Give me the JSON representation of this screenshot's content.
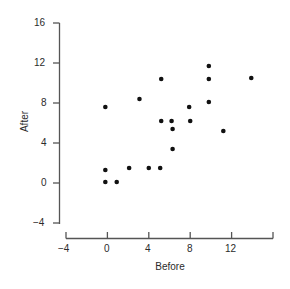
{
  "chart_data": {
    "type": "scatter",
    "title": "",
    "xlabel": "Before",
    "ylabel": "After",
    "xlim": [
      -4,
      16
    ],
    "ylim": [
      -4,
      16
    ],
    "xticks": [
      -4,
      0,
      4,
      8,
      12,
      16
    ],
    "xtick_labels": [
      "-4",
      "0",
      "4",
      "8",
      "12",
      ""
    ],
    "yticks": [
      -4,
      0,
      4,
      8,
      12,
      16
    ],
    "ytick_labels": [
      "-4",
      "0",
      "4",
      "8",
      "12",
      "16"
    ],
    "grid": false,
    "legend": null,
    "marker": "filled-circle",
    "marker_color": "#111111",
    "points": [
      {
        "x": -0.2,
        "y": 7.6
      },
      {
        "x": -0.2,
        "y": 1.3
      },
      {
        "x": -0.2,
        "y": 0.1
      },
      {
        "x": 0.9,
        "y": 0.1
      },
      {
        "x": 2.1,
        "y": 1.5
      },
      {
        "x": 3.1,
        "y": 8.4
      },
      {
        "x": 4.0,
        "y": 1.5
      },
      {
        "x": 5.1,
        "y": 1.5
      },
      {
        "x": 5.2,
        "y": 10.4
      },
      {
        "x": 5.2,
        "y": 6.2
      },
      {
        "x": 6.2,
        "y": 6.2
      },
      {
        "x": 6.3,
        "y": 5.4
      },
      {
        "x": 6.3,
        "y": 3.4
      },
      {
        "x": 7.9,
        "y": 7.6
      },
      {
        "x": 8.0,
        "y": 6.2
      },
      {
        "x": 9.8,
        "y": 11.7
      },
      {
        "x": 9.8,
        "y": 10.4
      },
      {
        "x": 9.8,
        "y": 8.1
      },
      {
        "x": 11.2,
        "y": 5.2
      },
      {
        "x": 13.9,
        "y": 10.5
      }
    ]
  },
  "axes": {
    "y_label": "After",
    "x_label": "Before",
    "y_tick_16": "16",
    "y_tick_12": "12",
    "y_tick_8": "8",
    "y_tick_4": "4",
    "y_tick_0": "0",
    "y_tick_neg4": "−4",
    "x_tick_neg4": "−4",
    "x_tick_0": "0",
    "x_tick_4": "4",
    "x_tick_8": "8",
    "x_tick_12": "12"
  }
}
